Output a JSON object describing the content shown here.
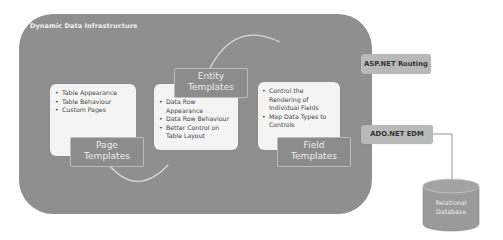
{
  "diagram": {
    "title": "Dynamic Data Infrastructure",
    "colors": {
      "container": "#8f8f8f",
      "panel": "#f4f4f4",
      "label_box": "#8c8c8c",
      "side_box": "#b9b9b9",
      "database": "#9a9a9a",
      "arrow": "#d8d8d8"
    },
    "page_templates": {
      "label_line1": "Page",
      "label_line2": "Templates",
      "items": [
        "Table Appearance",
        "Table Behaviour",
        "Custom Pages"
      ]
    },
    "entity_templates": {
      "label_line1": "Entity",
      "label_line2": "Templates",
      "items": [
        "Data Row Appearance",
        "Data Row Behaviour",
        "Better Control on Table Layout"
      ]
    },
    "field_templates": {
      "label_line1": "Field",
      "label_line2": "Templates",
      "items": [
        "Control the Rendering of Individual Fields",
        "Map Data Types to Controls"
      ]
    },
    "side_components": {
      "routing": "ASP.NET Routing",
      "edm": "ADO.NET EDM"
    },
    "database": {
      "line1": "Relational",
      "line2": "Database"
    }
  }
}
